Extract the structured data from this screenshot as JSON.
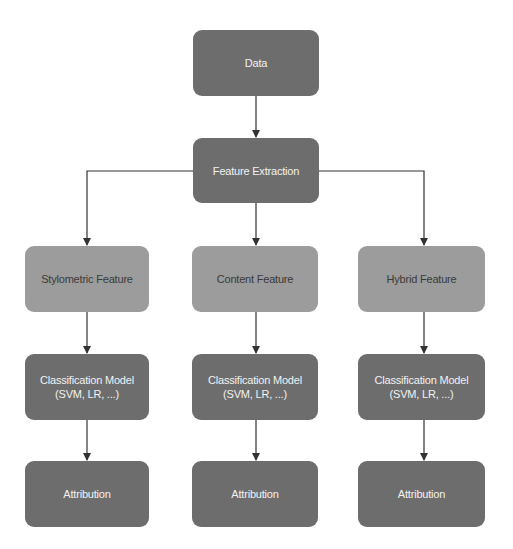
{
  "diagram": {
    "type": "flowchart",
    "colors": {
      "dark_node": "#6d6d6d",
      "light_node": "#9c9c9c",
      "dark_text": "#f2f2f2",
      "light_text": "#3a3a3a",
      "connector": "#333333",
      "background": "#ffffff"
    },
    "nodes": {
      "data": {
        "label": "Data"
      },
      "feature_extraction": {
        "label": "Feature Extraction"
      },
      "stylometric": {
        "label": "Stylometric Feature"
      },
      "content": {
        "label": "Content Feature"
      },
      "hybrid": {
        "label": "Hybrid Feature"
      },
      "classification_left": {
        "line1": "Classification Model",
        "line2": "(SVM, LR, ...)"
      },
      "classification_middle": {
        "line1": "Classification Model",
        "line2": "(SVM, LR, ...)"
      },
      "classification_right": {
        "line1": "Classification Model",
        "line2": "(SVM, LR, ...)"
      },
      "attribution_left": {
        "label": "Attribution"
      },
      "attribution_middle": {
        "label": "Attribution"
      },
      "attribution_right": {
        "label": "Attribution"
      }
    },
    "edges": [
      [
        "Data",
        "Feature Extraction"
      ],
      [
        "Feature Extraction",
        "Stylometric Feature"
      ],
      [
        "Feature Extraction",
        "Content Feature"
      ],
      [
        "Feature Extraction",
        "Hybrid Feature"
      ],
      [
        "Stylometric Feature",
        "Classification Model (SVM, LR, ...)"
      ],
      [
        "Content Feature",
        "Classification Model (SVM, LR, ...)"
      ],
      [
        "Hybrid Feature",
        "Classification Model (SVM, LR, ...)"
      ],
      [
        "Classification Model (SVM, LR, ...)",
        "Attribution"
      ],
      [
        "Classification Model (SVM, LR, ...)",
        "Attribution"
      ],
      [
        "Classification Model (SVM, LR, ...)",
        "Attribution"
      ]
    ]
  }
}
